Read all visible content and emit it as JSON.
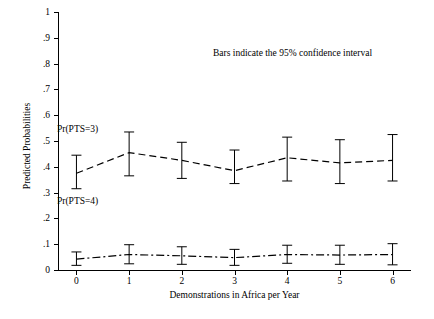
{
  "chart_data": {
    "type": "line",
    "title": "",
    "xlabel": "Demonstrations in Africa per Year",
    "ylabel": "Predicted Probabilities",
    "x": [
      0,
      1,
      2,
      3,
      4,
      5,
      6
    ],
    "xticklabels": [
      "0",
      "1",
      "2",
      "3",
      "4",
      "5",
      "6"
    ],
    "yticklabels": [
      "0",
      ".1",
      ".2",
      ".3",
      ".4",
      ".5",
      ".6",
      ".7",
      ".8",
      ".9",
      "1"
    ],
    "ylim": [
      0,
      1
    ],
    "xlim": [
      -0.35,
      6.35
    ],
    "grid": false,
    "legend_position": "inline-annotations",
    "annotations": [
      "Bars indicate the 95% confidence interval",
      "Pr(PTS=3)",
      "Pr(PTS=4)"
    ],
    "series": [
      {
        "name": "Pr(PTS=3)",
        "style": "dashed",
        "values": [
          0.375,
          0.455,
          0.425,
          0.385,
          0.435,
          0.415,
          0.425
        ],
        "ci_low": [
          0.315,
          0.365,
          0.355,
          0.335,
          0.345,
          0.335,
          0.345
        ],
        "ci_high": [
          0.445,
          0.535,
          0.495,
          0.465,
          0.515,
          0.505,
          0.525
        ]
      },
      {
        "name": "Pr(PTS=4)",
        "style": "dash-dot",
        "values": [
          0.042,
          0.06,
          0.055,
          0.048,
          0.06,
          0.058,
          0.06
        ],
        "ci_low": [
          0.018,
          0.024,
          0.022,
          0.018,
          0.026,
          0.022,
          0.02
        ],
        "ci_high": [
          0.07,
          0.098,
          0.09,
          0.08,
          0.096,
          0.096,
          0.102
        ]
      }
    ]
  }
}
